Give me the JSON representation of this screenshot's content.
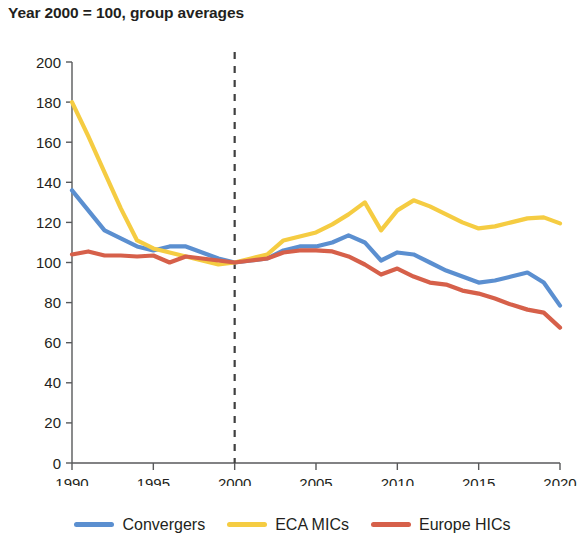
{
  "chart_title": "Year 2000 = 100, group averages",
  "axes": {
    "y_ticks": [
      "0",
      "20",
      "40",
      "60",
      "80",
      "100",
      "120",
      "140",
      "160",
      "180",
      "200"
    ],
    "x_ticks": [
      "1990",
      "1995",
      "2000",
      "2005",
      "2010",
      "2015",
      "2020"
    ],
    "reference_line_label": "2000"
  },
  "legend": {
    "items": [
      {
        "label": "Convergers",
        "color": "#5b8fd0",
        "icon": "line-swatch"
      },
      {
        "label": "ECA MICs",
        "color": "#f5cc42",
        "icon": "line-swatch"
      },
      {
        "label": "Europe HICs",
        "color": "#d6604a",
        "icon": "line-swatch"
      }
    ]
  },
  "chart_data": {
    "type": "line",
    "title": "Year 2000 = 100, group averages",
    "xlabel": "",
    "ylabel": "",
    "xlim": [
      1990,
      2020
    ],
    "ylim": [
      0,
      200
    ],
    "ytick_step": 20,
    "xtick_step": 5,
    "grid": false,
    "legend_position": "bottom",
    "annotations": [
      {
        "type": "vertical-dashed-line",
        "x": 2000,
        "label": "base year 2000 = 100"
      }
    ],
    "x": [
      1990,
      1991,
      1992,
      1993,
      1994,
      1995,
      1996,
      1997,
      1998,
      1999,
      2000,
      2001,
      2002,
      2003,
      2004,
      2005,
      2006,
      2007,
      2008,
      2009,
      2010,
      2011,
      2012,
      2013,
      2014,
      2015,
      2016,
      2017,
      2018,
      2019,
      2020
    ],
    "series": [
      {
        "name": "Convergers",
        "color": "#5b8fd0",
        "values": [
          136,
          126,
          116,
          112,
          108,
          106,
          108,
          108,
          105,
          102,
          100,
          101,
          102,
          106,
          108,
          108,
          110,
          113.5,
          110,
          101,
          105,
          104,
          100,
          96,
          93,
          90,
          91,
          93,
          95,
          90,
          78.5
        ]
      },
      {
        "name": "ECA MICs",
        "color": "#f5cc42",
        "values": [
          180,
          163,
          145,
          127,
          111,
          107,
          105,
          103,
          101,
          99,
          100,
          102,
          104,
          111,
          113,
          115,
          119,
          124,
          130,
          116,
          126,
          131,
          128,
          124,
          120,
          117,
          118,
          120,
          122,
          122.5,
          119.5
        ]
      },
      {
        "name": "Europe HICs",
        "color": "#d6604a",
        "values": [
          104,
          105.5,
          103.5,
          103.5,
          103,
          103.5,
          100,
          103,
          102,
          101,
          100,
          101,
          102,
          105,
          106,
          106,
          105.5,
          103,
          99,
          94,
          97,
          93,
          90,
          89,
          86,
          84.5,
          82,
          79,
          76.5,
          75,
          67.5
        ]
      }
    ]
  }
}
